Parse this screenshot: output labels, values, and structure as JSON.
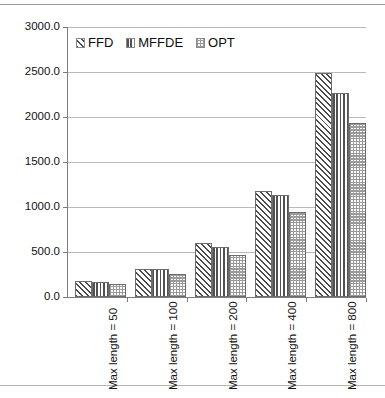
{
  "chart_data": {
    "type": "bar",
    "title": "",
    "xlabel": "",
    "ylabel": "",
    "categories": [
      "Max length = 50",
      "Max length = 100",
      "Max length = 200",
      "Max length = 400",
      "Max length = 800"
    ],
    "series": [
      {
        "name": "FFD",
        "pattern": "diagonal-hatch",
        "values": [
          175,
          310,
          595,
          1180,
          2490
        ]
      },
      {
        "name": "MFFDE",
        "pattern": "vertical-lines",
        "values": [
          170,
          310,
          560,
          1135,
          2265
        ]
      },
      {
        "name": "OPT",
        "pattern": "checkerboard",
        "values": [
          140,
          260,
          470,
          950,
          1935
        ]
      }
    ],
    "ylim": [
      0,
      3000
    ],
    "ytick_values": [
      0,
      500,
      1000,
      1500,
      2000,
      2500,
      3000
    ],
    "ytick_labels": [
      "0.0",
      "500.0",
      "1000.0",
      "1500.0",
      "2000.0",
      "2500.0",
      "3000.0"
    ],
    "grid": true,
    "legend_position": "top-left-inside",
    "legend": [
      "FFD",
      "MFFDE",
      "OPT"
    ],
    "colors": {
      "series_line": "#4a4a4a",
      "grid": "#b9b9b9",
      "axis": "#7d7d7d",
      "background": "#ffffff",
      "text": "#121212"
    }
  }
}
